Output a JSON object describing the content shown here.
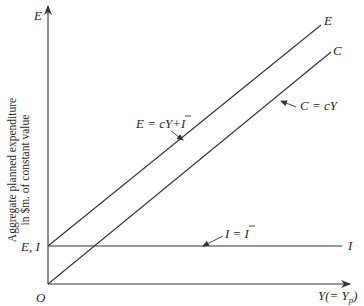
{
  "diagram": {
    "type": "keynesian-cross",
    "axes": {
      "y_axis_symbol": "E",
      "x_axis_label": "Y(= Y",
      "x_axis_label_sub": "p",
      "x_axis_label_close": ")",
      "origin_label": "O",
      "intercept_label": "E, I",
      "y_axis_title_line1": "Aggregate planned expenditure",
      "y_axis_title_line2": "in $m. of constant value"
    },
    "lines": [
      {
        "name": "aggregate-expenditure",
        "end_label": "E",
        "equation": "E = cY + Ī"
      },
      {
        "name": "consumption",
        "end_label": "C",
        "equation": "C = cY"
      },
      {
        "name": "investment",
        "end_label": "I",
        "equation": "I = Ī"
      }
    ],
    "equations": {
      "e_eq_prefix": "E = cY+",
      "e_eq_ibar": "I",
      "c_eq": "C = cY",
      "i_eq_prefix": "I = ",
      "i_eq_ibar": "I"
    },
    "colors": {
      "ink": "#333333",
      "background": "#ffffff"
    }
  }
}
